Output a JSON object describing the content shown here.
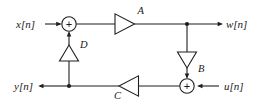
{
  "diagram": {
    "type": "signal-flow-graph",
    "canvas": {
      "width": 256,
      "height": 105,
      "background": "#ffffff"
    },
    "line_color": "#1f1f1f",
    "signals": {
      "input_x": "x[n]",
      "output_w": "w[n]",
      "output_y": "y[n]",
      "input_u": "u[n]"
    },
    "gains": {
      "a": "A",
      "b": "B",
      "c": "C",
      "d": "D"
    },
    "adders": {
      "top_sign": "+",
      "bottom_sign": "+"
    },
    "nodes": {
      "top_adder": {
        "x": 69,
        "y": 24
      },
      "bottom_adder": {
        "x": 187,
        "y": 86
      },
      "w_junction": {
        "x": 187,
        "y": 24
      },
      "y_junction": {
        "x": 69,
        "y": 86
      }
    },
    "triangles": {
      "a": {
        "direction": "right",
        "cx": 125,
        "cy": 24
      },
      "b": {
        "direction": "down",
        "cx": 187,
        "cy": 60
      },
      "c": {
        "direction": "left",
        "cx": 129,
        "cy": 86
      },
      "d": {
        "direction": "up",
        "cx": 69,
        "cy": 53
      }
    }
  }
}
